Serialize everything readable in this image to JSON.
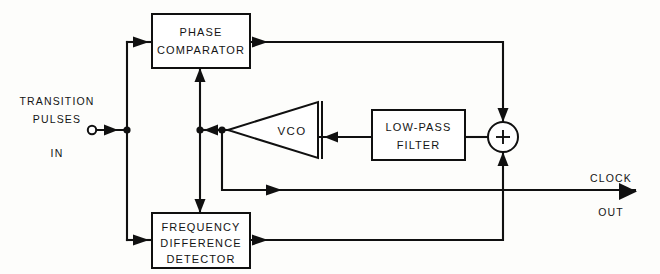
{
  "diagram": {
    "blocks": {
      "phase_comparator": {
        "line1": "PHASE",
        "line2": "COMPARATOR"
      },
      "frequency_difference_detector": {
        "line1": "FREQUENCY",
        "line2": "DIFFERENCE",
        "line3": "DETECTOR"
      },
      "low_pass_filter": {
        "line1": "LOW-PASS",
        "line2": "FILTER"
      },
      "vco": {
        "label": "VCO"
      },
      "summer": {
        "symbol": "+"
      }
    },
    "io": {
      "input": {
        "line1": "TRANSITION",
        "line2": "PULSES",
        "line3": "IN"
      },
      "output": {
        "line1": "CLOCK",
        "line2": "OUT"
      }
    },
    "colors": {
      "ink": "#101010",
      "paper": "#fdfdfb"
    }
  }
}
